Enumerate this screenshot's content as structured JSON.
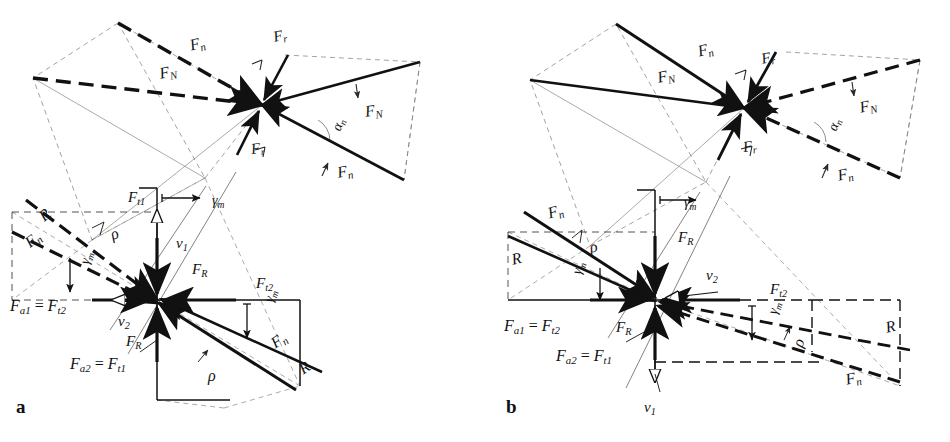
{
  "figure": {
    "type": "technical-force-diagram",
    "background": "#ffffff",
    "ink": "#111111",
    "panels": [
      {
        "id": "a",
        "letter": "a",
        "letter_pos": {
          "x": 16,
          "y": 398
        },
        "hubs": [
          {
            "name": "upper-hub",
            "x": 262,
            "y": 105
          },
          {
            "name": "center-hub",
            "x": 157,
            "y": 300
          }
        ],
        "labels": [
          {
            "name": "label-fn-upper-left",
            "tex": "F_n",
            "base": "F",
            "sub": "n",
            "x": 188,
            "y": 38,
            "size": "f16",
            "rot": -14
          },
          {
            "name": "label-fN-upper-left",
            "tex": "F_N",
            "base": "F",
            "sub": "N",
            "x": 158,
            "y": 66,
            "size": "f16",
            "rot": -11
          },
          {
            "name": "label-fr-upper-top",
            "tex": "F_r",
            "base": "F",
            "sub": "r",
            "x": 272,
            "y": 30,
            "size": "f15",
            "rot": -12
          },
          {
            "name": "label-fr-upper-bottom",
            "tex": "F_r",
            "base": "F",
            "sub": "r",
            "x": 250,
            "y": 142,
            "size": "f15",
            "rot": -8
          },
          {
            "name": "label-fN-upper-right",
            "tex": "F_N",
            "base": "F",
            "sub": "N",
            "x": 364,
            "y": 104,
            "size": "f16",
            "rot": -8
          },
          {
            "name": "label-fn-upper-right",
            "tex": "F_n",
            "base": "F",
            "sub": "n",
            "x": 336,
            "y": 165,
            "size": "f16",
            "rot": -10
          },
          {
            "name": "label-alpha-n-upper",
            "tex": "α_n",
            "base": "α",
            "sub": "n",
            "x": 330,
            "y": 128,
            "size": "f14",
            "rot": -70
          },
          {
            "name": "label-R-left",
            "tex": "R",
            "base": "R",
            "sub": "",
            "x": 36,
            "y": 212,
            "size": "f16",
            "rot": -40
          },
          {
            "name": "label-fn-left",
            "tex": "F_n",
            "base": "F",
            "sub": "n",
            "x": 22,
            "y": 238,
            "size": "f16",
            "rot": -38
          },
          {
            "name": "label-rho-left",
            "tex": "ρ",
            "base": "ρ",
            "sub": "",
            "x": 108,
            "y": 228,
            "size": "f17",
            "rot": -22
          },
          {
            "name": "label-gamma-m-left",
            "tex": "γ_m",
            "base": "γ",
            "sub": "m",
            "x": 78,
            "y": 262,
            "size": "f14",
            "rot": -74
          },
          {
            "name": "label-ft1",
            "tex": "F_t1",
            "base": "F",
            "sub": "t1",
            "x": 128,
            "y": 190,
            "size": "f15",
            "rot": 0
          },
          {
            "name": "label-gamma-m-top",
            "tex": "γ_m",
            "base": "γ",
            "sub": "m",
            "x": 212,
            "y": 194,
            "size": "f14",
            "rot": 0
          },
          {
            "name": "label-v1",
            "tex": "v_1",
            "base": "v",
            "sub": "1",
            "x": 176,
            "y": 236,
            "size": "f15",
            "rot": 0
          },
          {
            "name": "label-fR-upper",
            "tex": "F_R",
            "base": "F",
            "sub": "R",
            "x": 192,
            "y": 262,
            "size": "f15",
            "rot": 0
          },
          {
            "name": "label-v2",
            "tex": "v_2",
            "base": "v",
            "sub": "2",
            "x": 118,
            "y": 314,
            "size": "f15",
            "rot": 0
          },
          {
            "name": "label-fR-lower",
            "tex": "F_R",
            "base": "F",
            "sub": "R",
            "x": 126,
            "y": 334,
            "size": "f15",
            "rot": 0
          },
          {
            "name": "label-fa1-ft2",
            "tex": "F_a1 = F_t2",
            "base": "",
            "sub": "",
            "x": 10,
            "y": 298,
            "size": "f16",
            "rot": 0
          },
          {
            "name": "label-fa2-ft1",
            "tex": "F_a2 = F_t1",
            "base": "",
            "sub": "",
            "x": 70,
            "y": 356,
            "size": "f16",
            "rot": 0
          },
          {
            "name": "label-ft2",
            "tex": "F_t2",
            "base": "F",
            "sub": "t2",
            "x": 256,
            "y": 276,
            "size": "f15",
            "rot": 0
          },
          {
            "name": "label-gamma-m-right",
            "tex": "γ_m",
            "base": "γ",
            "sub": "m",
            "x": 262,
            "y": 300,
            "size": "f14",
            "rot": -74
          },
          {
            "name": "label-fn-right",
            "tex": "F_n",
            "base": "F",
            "sub": "n",
            "x": 268,
            "y": 338,
            "size": "f16",
            "rot": -34
          },
          {
            "name": "label-R-right",
            "tex": "R",
            "base": "R",
            "sub": "",
            "x": 296,
            "y": 364,
            "size": "f16",
            "rot": -34
          },
          {
            "name": "label-rho-right",
            "tex": "ρ",
            "base": "ρ",
            "sub": "",
            "x": 208,
            "y": 368,
            "size": "f17",
            "rot": 0
          }
        ]
      },
      {
        "id": "b",
        "letter": "b",
        "letter_pos": {
          "x": 506,
          "y": 398
        },
        "hubs": [
          {
            "name": "upper-hub",
            "x": 744,
            "y": 108
          },
          {
            "name": "center-hub",
            "x": 655,
            "y": 300
          }
        ],
        "labels": [
          {
            "name": "label-fn-upper-left",
            "tex": "F_n",
            "base": "F",
            "sub": "n",
            "x": 696,
            "y": 44,
            "size": "f16",
            "rot": -14
          },
          {
            "name": "label-fN-upper-left",
            "tex": "F_N",
            "base": "F",
            "sub": "N",
            "x": 656,
            "y": 70,
            "size": "f16",
            "rot": -11
          },
          {
            "name": "label-fr-upper-top",
            "tex": "F_r",
            "base": "F",
            "sub": "r",
            "x": 760,
            "y": 52,
            "size": "f15",
            "rot": -12
          },
          {
            "name": "label-fr-upper-bottom",
            "tex": "F_r",
            "base": "F",
            "sub": "r",
            "x": 742,
            "y": 140,
            "size": "f15",
            "rot": -8
          },
          {
            "name": "label-fN-upper-right",
            "tex": "F_N",
            "base": "F",
            "sub": "N",
            "x": 858,
            "y": 100,
            "size": "f16",
            "rot": -12
          },
          {
            "name": "label-fn-upper-right",
            "tex": "F_n",
            "base": "F",
            "sub": "n",
            "x": 836,
            "y": 168,
            "size": "f16",
            "rot": -12
          },
          {
            "name": "label-alpha-n-upper",
            "tex": "α_n",
            "base": "α",
            "sub": "n",
            "x": 826,
            "y": 128,
            "size": "f14",
            "rot": -70
          },
          {
            "name": "label-fn-left",
            "tex": "F_n",
            "base": "F",
            "sub": "n",
            "x": 546,
            "y": 206,
            "size": "f16",
            "rot": -16
          },
          {
            "name": "label-R-left",
            "tex": "R",
            "base": "R",
            "sub": "",
            "x": 510,
            "y": 252,
            "size": "f16",
            "rot": -12
          },
          {
            "name": "label-rho-left",
            "tex": "ρ",
            "base": "ρ",
            "sub": "",
            "x": 588,
            "y": 240,
            "size": "f17",
            "rot": -12
          },
          {
            "name": "label-gamma-m-left",
            "tex": "γ_m",
            "base": "γ",
            "sub": "m",
            "x": 570,
            "y": 272,
            "size": "f14",
            "rot": -74
          },
          {
            "name": "label-gamma-m-top",
            "tex": "γ_m",
            "base": "γ",
            "sub": "m",
            "x": 684,
            "y": 196,
            "size": "f14",
            "rot": 0
          },
          {
            "name": "label-fR-upper",
            "tex": "F_R",
            "base": "F",
            "sub": "R",
            "x": 678,
            "y": 230,
            "size": "f15",
            "rot": 0
          },
          {
            "name": "label-v2",
            "tex": "v_2",
            "base": "v",
            "sub": "2",
            "x": 706,
            "y": 268,
            "size": "f15",
            "rot": 0
          },
          {
            "name": "label-fa1-ft2",
            "tex": "F_a1 = F_t2",
            "base": "",
            "sub": "",
            "x": 504,
            "y": 318,
            "size": "f16",
            "rot": 0
          },
          {
            "name": "label-fR-lower",
            "tex": "F_R",
            "base": "F",
            "sub": "R",
            "x": 616,
            "y": 320,
            "size": "f15",
            "rot": 0
          },
          {
            "name": "label-fa2-ft1",
            "tex": "F_a2 = F_t1",
            "base": "",
            "sub": "",
            "x": 556,
            "y": 348,
            "size": "f16",
            "rot": 0
          },
          {
            "name": "label-v1",
            "tex": "v_1",
            "base": "v",
            "sub": "1",
            "x": 644,
            "y": 400,
            "size": "f15",
            "rot": 0
          },
          {
            "name": "label-ft2",
            "tex": "F_t2",
            "base": "F",
            "sub": "t2",
            "x": 770,
            "y": 282,
            "size": "f15",
            "rot": 0
          },
          {
            "name": "label-gamma-m-right",
            "tex": "γ_m",
            "base": "γ",
            "sub": "m",
            "x": 766,
            "y": 312,
            "size": "f14",
            "rot": -74
          },
          {
            "name": "label-rho-right",
            "tex": "ρ",
            "base": "ρ",
            "sub": "",
            "x": 790,
            "y": 344,
            "size": "f17",
            "rot": -72
          },
          {
            "name": "label-R-right",
            "tex": "R",
            "base": "R",
            "sub": "",
            "x": 884,
            "y": 320,
            "size": "f16",
            "rot": -12
          },
          {
            "name": "label-fn-right",
            "tex": "F_n",
            "base": "F",
            "sub": "n",
            "x": 844,
            "y": 372,
            "size": "f16",
            "rot": -12
          }
        ]
      }
    ],
    "symbols": {
      "force_normal_tooth": "F_n",
      "force_normal": "F_N",
      "force_radial": "F_r",
      "force_tangential_1": "F_t1",
      "force_tangential_2": "F_t2",
      "force_axial_1": "F_a1",
      "force_axial_2": "F_a2",
      "force_resultant": "F_R",
      "reaction": "R",
      "velocity_1": "v_1",
      "velocity_2": "v_2",
      "pressure_angle": "α_n",
      "mean_helix_angle": "γ_m",
      "friction_angle": "ρ"
    }
  }
}
